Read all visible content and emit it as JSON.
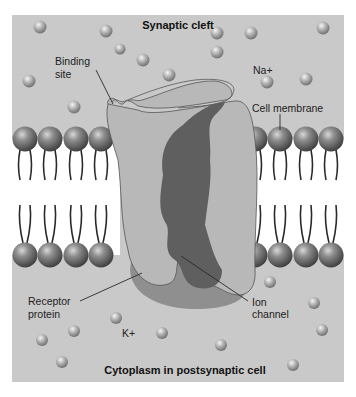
{
  "diagram": {
    "title_top": "Synaptic cleft",
    "title_bottom": "Cytoplasm in postsynaptic cell",
    "labels": {
      "binding_site_line1": "Binding",
      "binding_site_line2": "site",
      "na_ion": "Na+",
      "cell_membrane": "Cell membrane",
      "receptor_protein_line1": "Receptor",
      "receptor_protein_line2": "protein",
      "k_ion": "K+",
      "ion_channel_line1": "Ion",
      "ion_channel_line2": "channel"
    },
    "colors": {
      "background_panel": "#c9c9c9",
      "membrane_gap": "#ffffff",
      "protein_light": "#b4b4b4",
      "protein_mid": "#8a8a8a",
      "ion_channel_dark": "#5e5e5e",
      "phospholipid_head": "#6a6a6a",
      "ion_ball": "#a8a8a8"
    }
  }
}
